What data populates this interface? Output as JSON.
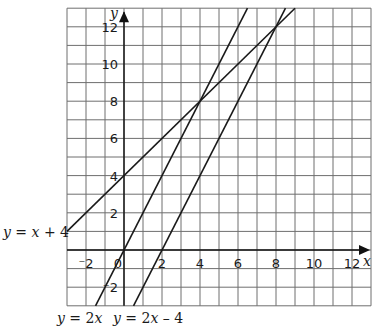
{
  "chart_data": {
    "type": "line",
    "title": "",
    "xlabel": "x",
    "ylabel": "y",
    "xlim": [
      -3,
      13
    ],
    "ylim": [
      -3,
      13
    ],
    "grid": true,
    "x_ticks": [
      -2,
      0,
      2,
      4,
      6,
      8,
      10,
      12
    ],
    "y_ticks": [
      -2,
      2,
      4,
      6,
      8,
      10,
      12
    ],
    "x_tick_labels": [
      "⁻2",
      "0",
      "2",
      "4",
      "6",
      "8",
      "10",
      "12"
    ],
    "y_tick_labels": [
      "⁻2",
      "2",
      "4",
      "6",
      "8",
      "10",
      "12"
    ],
    "series": [
      {
        "name": "y = x + 4",
        "equation": "y = x + 4",
        "points": [
          [
            -3,
            1
          ],
          [
            9,
            13
          ]
        ]
      },
      {
        "name": "y = 2x",
        "equation": "y = 2x",
        "points": [
          [
            -1.5,
            -3
          ],
          [
            6.5,
            13
          ]
        ]
      },
      {
        "name": "y = 2x – 4",
        "equation": "y = 2x – 4",
        "points": [
          [
            0.5,
            -3
          ],
          [
            8.5,
            13
          ]
        ]
      }
    ],
    "intersections": [
      [
        4,
        8
      ],
      [
        8,
        12
      ]
    ]
  },
  "labels": {
    "y_axis": "y",
    "x_axis": "x",
    "line1": {
      "y": "y",
      "rest": " = ",
      "x": "x",
      "tail": " + 4"
    },
    "line2": {
      "y": "y",
      "rest": " = 2",
      "x": "x",
      "tail": ""
    },
    "line3": {
      "y": "y",
      "rest": " = 2",
      "x": "x",
      "tail": " – 4"
    }
  }
}
